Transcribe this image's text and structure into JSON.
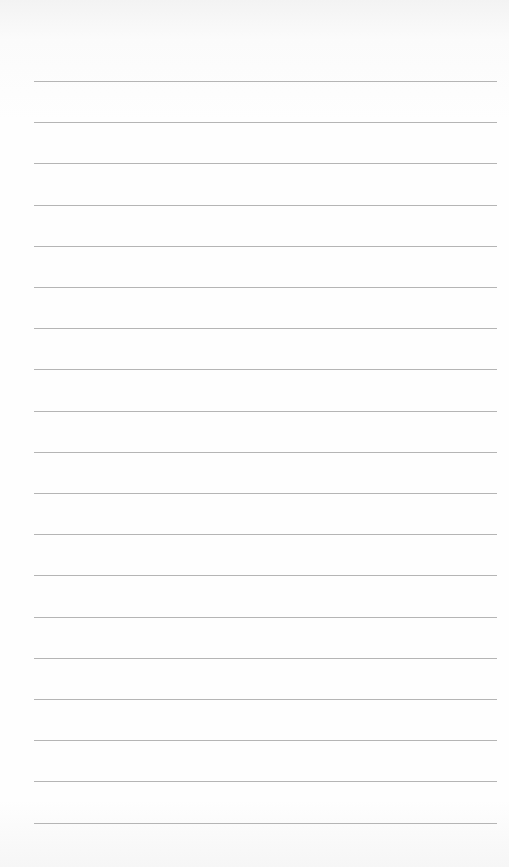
{
  "paper": {
    "type": "lined-paper",
    "background_color": "#fdfdfd",
    "line_color": "#b5b5b5",
    "line_count": 19,
    "first_line_y": 81,
    "line_spacing": 41.2,
    "line_left": 34,
    "line_right": 497
  }
}
